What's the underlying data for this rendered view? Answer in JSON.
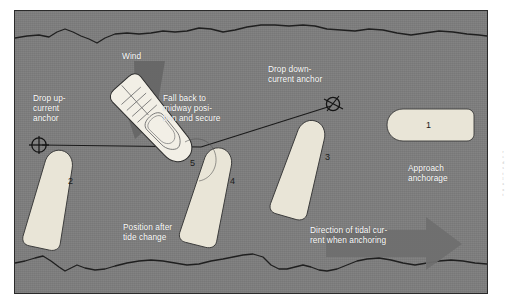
{
  "figure": {
    "background_color": "#7d7d7d",
    "boat_fill_color": "#e9e5d7",
    "boat_stroke_color": "#3a3a3a",
    "label_color": "#ffffff",
    "arrow_color": "#636363",
    "frame_border_color": "#2a2a2a"
  },
  "labels": {
    "wind": "Wind",
    "drop_up_current_anchor": "Drop up-\ncurrent\nanchor",
    "fall_back": "Fall back to\nmidway posi-\ntion and secure",
    "drop_down_current_anchor": "Drop down-\ncurrent anchor",
    "approach_anchorage": "Approach\nanchorage",
    "position_after_tide_change": "Position after\ntide change",
    "direction_of_tidal_current": "Direction of tidal cur-\nrent when anchoring"
  },
  "boats": [
    {
      "number": "1",
      "role": "approach-anchorage",
      "heading": "bow-left-level"
    },
    {
      "number": "2",
      "role": "up-current-anchor-drop",
      "heading": "bow-up-slight-right-lean"
    },
    {
      "number": "3",
      "role": "down-current-anchor-drop",
      "heading": "bow-up-left-lean"
    },
    {
      "number": "4",
      "role": "falling-back",
      "heading": "bow-up-slight-right-lean"
    },
    {
      "number": "5",
      "role": "position-after-tide-change",
      "heading": "rotated-45-bow-up-right"
    }
  ],
  "anchors": [
    {
      "name": "up-current-anchor",
      "position": "left"
    },
    {
      "name": "down-current-anchor",
      "position": "upper-right"
    }
  ],
  "arrows": [
    {
      "name": "wind-arrow",
      "direction": "down-left",
      "color": "#636363"
    },
    {
      "name": "tidal-current-arrow",
      "direction": "right",
      "color": "#6e6e6e"
    }
  ],
  "shorelines": [
    {
      "name": "top-shoreline"
    },
    {
      "name": "bottom-shoreline"
    }
  ],
  "rodes": [
    {
      "name": "rode-to-up-current-anchor"
    },
    {
      "name": "rode-to-down-current-anchor"
    }
  ],
  "page_edge_text": {
    "fragments": "r\ne\nd\ns\nt\nl\na\nn\nt"
  }
}
